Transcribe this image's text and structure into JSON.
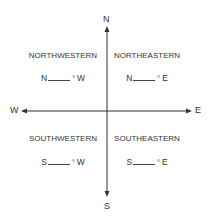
{
  "compass": {
    "north": "N",
    "south": "S",
    "east": "E",
    "west": "W"
  },
  "quadrants": {
    "northwest": {
      "title": "NORTHWESTERN",
      "prefix": "N",
      "degree": "°",
      "suffix": "W"
    },
    "northeast": {
      "title": "NORTHEASTERN",
      "prefix": "N",
      "degree": "°",
      "suffix": "E"
    },
    "southwest": {
      "title": "SOUTHWESTERN",
      "prefix": "S",
      "degree": "°",
      "suffix": "W"
    },
    "southeast": {
      "title": "SOUTHEASTERN",
      "prefix": "S",
      "degree": "°",
      "suffix": "E"
    }
  },
  "colors": {
    "axis": "#333333",
    "text": "#333333",
    "background": "#ffffff"
  }
}
